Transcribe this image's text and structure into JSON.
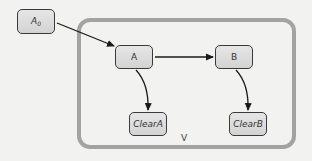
{
  "diagram": {
    "container": {
      "label": "V",
      "border_color": "#a3a3a3"
    },
    "nodes": [
      {
        "id": "A0",
        "label": "A",
        "subscript": "0",
        "italic": true
      },
      {
        "id": "A",
        "label": "A",
        "italic": false
      },
      {
        "id": "B",
        "label": "B",
        "italic": false
      },
      {
        "id": "ClearA",
        "label": "ClearA",
        "italic": true
      },
      {
        "id": "ClearB",
        "label": "ClearB",
        "italic": true
      }
    ],
    "edges": [
      {
        "from": "A0",
        "to": "A",
        "style": "straight"
      },
      {
        "from": "A",
        "to": "B",
        "style": "straight"
      },
      {
        "from": "A",
        "to": "ClearA",
        "style": "curved"
      },
      {
        "from": "B",
        "to": "ClearB",
        "style": "curved"
      }
    ],
    "colors": {
      "background": "#f2f2f0",
      "node_fill_top": "#e6e6e6",
      "node_fill_bottom": "#d3d3d3",
      "node_border": "#3a3a3a",
      "edge": "#1a1a1a"
    }
  }
}
